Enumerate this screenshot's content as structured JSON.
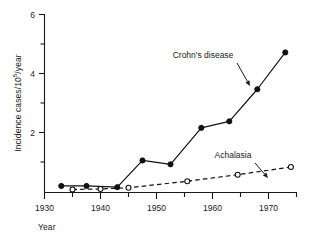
{
  "chart_data": {
    "type": "line",
    "title": "",
    "xlabel": "Year",
    "ylabel_plain": "Incidence cases/10^5/year",
    "ylabel_prefix": "Incidence cases/10",
    "ylabel_exponent": "5",
    "ylabel_suffix": "/year",
    "xlim": [
      1930,
      1975
    ],
    "ylim": [
      0,
      6
    ],
    "x_major_ticks": [
      1930,
      1940,
      1950,
      1960,
      1970
    ],
    "x_major_tick_labels": [
      "1930",
      "1940",
      "1950",
      "1960",
      "1970"
    ],
    "x_minor_ticks": [
      1935,
      1945,
      1955,
      1965,
      1975
    ],
    "y_major_ticks": [
      2,
      4,
      6
    ],
    "y_major_tick_labels": [
      "2",
      "4",
      "6"
    ],
    "y_minor_ticks": [
      1,
      3,
      5
    ],
    "grid": false,
    "legend_position": "inline-annotations",
    "series": [
      {
        "name": "Crohn's disease",
        "marker": "filled-circle",
        "linestyle": "solid",
        "color": "#111111",
        "points": [
          {
            "x": 1933,
            "y": 0.22
          },
          {
            "x": 1937.5,
            "y": 0.22
          },
          {
            "x": 1943,
            "y": 0.18
          },
          {
            "x": 1947.5,
            "y": 1.08
          },
          {
            "x": 1952.5,
            "y": 0.95
          },
          {
            "x": 1958,
            "y": 2.18
          },
          {
            "x": 1963,
            "y": 2.4
          },
          {
            "x": 1968,
            "y": 3.48
          },
          {
            "x": 1973,
            "y": 4.72
          }
        ]
      },
      {
        "name": "Achalasia",
        "marker": "open-circle",
        "linestyle": "dashed",
        "color": "#111111",
        "points": [
          {
            "x": 1935,
            "y": 0.1
          },
          {
            "x": 1940,
            "y": 0.12
          },
          {
            "x": 1945,
            "y": 0.16
          },
          {
            "x": 1955.5,
            "y": 0.38
          },
          {
            "x": 1964.5,
            "y": 0.6
          },
          {
            "x": 1974,
            "y": 0.86
          }
        ]
      }
    ],
    "annotations": [
      {
        "label": "Crohn's disease",
        "text_x": 203,
        "text_y": 58,
        "arrow_from_x": 237,
        "arrow_from_y": 63,
        "arrow_to_x": 250,
        "arrow_to_y": 86
      },
      {
        "label": "Achalasia",
        "text_x": 233,
        "text_y": 158,
        "arrow_from_x": 255,
        "arrow_from_y": 163,
        "arrow_to_x": 268,
        "arrow_to_y": 178
      }
    ]
  }
}
